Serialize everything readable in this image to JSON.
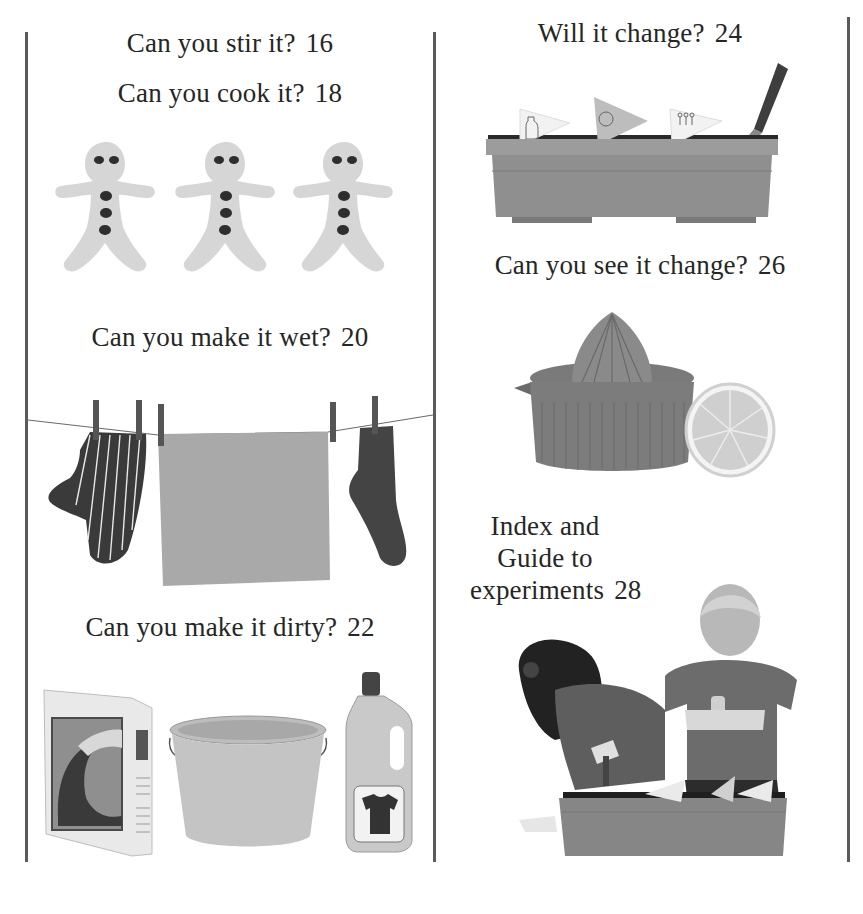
{
  "page": {
    "type": "contents-page",
    "style": "grayscale"
  },
  "left_column": {
    "entries": [
      {
        "title": "Can you stir it?",
        "page": "16"
      },
      {
        "title": "Can you cook it?",
        "page": "18",
        "illustration": "gingerbread-men"
      },
      {
        "title": "Can you make it wet?",
        "page": "20",
        "illustration": "clothesline-laundry"
      },
      {
        "title": "Can you make it dirty?",
        "page": "22",
        "illustration": "detergent-bucket-bottle"
      }
    ]
  },
  "right_column": {
    "entries": [
      {
        "title": "Will it change?",
        "page": "24",
        "illustration": "planter-box-with-trowel"
      },
      {
        "title": "Can you see it change?",
        "page": "26",
        "illustration": "citrus-juicer-and-lemon"
      },
      {
        "title_lines": [
          "Index and",
          "Guide to",
          "experiments"
        ],
        "page": "28",
        "illustration": "children-planting"
      }
    ]
  },
  "colors": {
    "rule": "#5a5a5a",
    "text": "#262626",
    "background": "#ffffff"
  }
}
